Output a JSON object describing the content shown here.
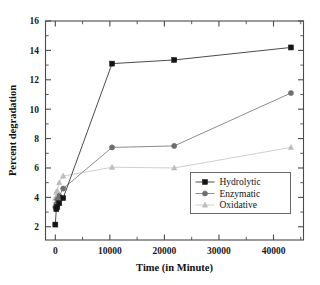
{
  "chart_data": {
    "type": "line",
    "title": "",
    "xlabel": "Time (in Minute)",
    "ylabel": "Percent degradation",
    "xlim": [
      -1800,
      45500
    ],
    "ylim": [
      1.1,
      16
    ],
    "grid": false,
    "legend_position": "lower-right",
    "xticks": [
      0,
      10000,
      20000,
      30000,
      40000
    ],
    "xticklabels": [
      "0",
      "10000",
      "20000",
      "30000",
      "40000"
    ],
    "yticks": [
      2,
      4,
      6,
      8,
      10,
      12,
      14,
      16
    ],
    "yticklabels": [
      "2",
      "4",
      "6",
      "8",
      "10",
      "12",
      "14",
      "16"
    ],
    "series": [
      {
        "name": "Hydrolytic",
        "marker": "square",
        "color": "#151515",
        "line_color": "#4c4c4c",
        "x": [
          0,
          180,
          360,
          720,
          1440,
          10400,
          21800,
          43200
        ],
        "y": [
          2.15,
          3.2,
          3.35,
          3.6,
          3.95,
          13.1,
          13.35,
          14.2
        ]
      },
      {
        "name": "Enzymatic",
        "marker": "circle",
        "color": "#6e6e6e",
        "line_color": "#8c8c8c",
        "x": [
          0,
          180,
          360,
          720,
          1440,
          10400,
          21800,
          43200
        ],
        "y": [
          3.35,
          3.55,
          3.85,
          4.1,
          4.6,
          7.4,
          7.5,
          11.1
        ]
      },
      {
        "name": "Oxidative",
        "marker": "triangle",
        "color": "#bdbdbd",
        "line_color": "#cfcfcf",
        "x": [
          0,
          180,
          360,
          720,
          1440,
          10400,
          21800,
          43200
        ],
        "y": [
          3.95,
          4.35,
          4.45,
          5.0,
          5.45,
          6.05,
          6.0,
          7.4
        ]
      }
    ]
  },
  "legend": {
    "items": [
      {
        "label": "Hydrolytic"
      },
      {
        "label": "Enzymatic"
      },
      {
        "label": "Oxidative"
      }
    ]
  }
}
